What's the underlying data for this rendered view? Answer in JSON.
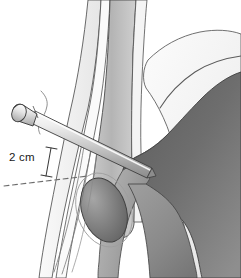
{
  "figure": {
    "background_color": "#ffffff",
    "width": 241,
    "height": 278
  },
  "annotations": {
    "measurement_label": "2 cm",
    "measurement_label_color": "#1a1a1a",
    "measurement_bracket": {
      "name": "measurement-bracket",
      "description": "vertical caliper bracket with end caps"
    },
    "reference_line": {
      "name": "dashed-reference-line",
      "style": "dashed",
      "color": "#6d6d6d"
    }
  },
  "structures": [
    {
      "name": "spine-band-outer-left",
      "label": "outer spinal band",
      "fill": "#f2f2f2",
      "stroke": "#4a4a4a"
    },
    {
      "name": "spine-band-inner",
      "label": "inner spinal band",
      "fill": "#b7b7b7",
      "stroke": "#4a4a4a"
    },
    {
      "name": "spine-band-outer-right",
      "label": "right spinal margin",
      "fill": "#ededed",
      "stroke": "#4a4a4a"
    },
    {
      "name": "iliac-wing",
      "label": "iliac wing",
      "fill": "#efefef",
      "stroke": "#555555"
    },
    {
      "name": "ilium-dark-mass",
      "label": "ilium dense bone mass",
      "fill": "#6e6e6e",
      "stroke": "#3f3f3f"
    },
    {
      "name": "obturator-foramen",
      "label": "obturator foramen",
      "fill": "#7d7d7d",
      "stroke": "#3f3f3f"
    },
    {
      "name": "pubic-ramus",
      "label": "pubic ramus",
      "fill": "#9a9a9a",
      "stroke": "#4a4a4a"
    },
    {
      "name": "ischium-body",
      "label": "ischium body",
      "fill": "#8c8c8c",
      "stroke": "#444444"
    }
  ],
  "implant": {
    "name": "surgical-nail",
    "label": "nail / pin implant",
    "head_shape": "mushroom-flange",
    "shaft_fill_light": "#f1f1f1",
    "shaft_fill_mid": "#c6c6c6",
    "shaft_fill_dark": "#8f8f8f",
    "stroke": "#3d3d3d"
  },
  "colors": {
    "background": "#ffffff",
    "outline": "#3f3f3f",
    "dark_bone": "#6e6e6e",
    "mid_bone": "#b7b7b7",
    "light_bone": "#efefef",
    "text": "#1a1a1a"
  }
}
